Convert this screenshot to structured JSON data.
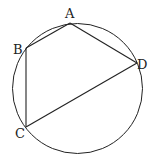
{
  "diagram": {
    "circle": {
      "cx": 77.5,
      "cy": 88.5,
      "r": 65
    },
    "points": [
      {
        "name": "A",
        "x": 70,
        "y": 23,
        "lx": 65,
        "ly": 18
      },
      {
        "name": "B",
        "x": 26,
        "y": 48,
        "lx": 12,
        "ly": 54
      },
      {
        "name": "C",
        "x": 26,
        "y": 127,
        "lx": 14,
        "ly": 138
      },
      {
        "name": "D",
        "x": 137,
        "y": 63,
        "lx": 137,
        "ly": 69
      }
    ],
    "segments": [
      "AB",
      "BC",
      "CD",
      "DA"
    ],
    "labels": {
      "A": "A",
      "B": "B",
      "C": "C",
      "D": "D"
    }
  }
}
